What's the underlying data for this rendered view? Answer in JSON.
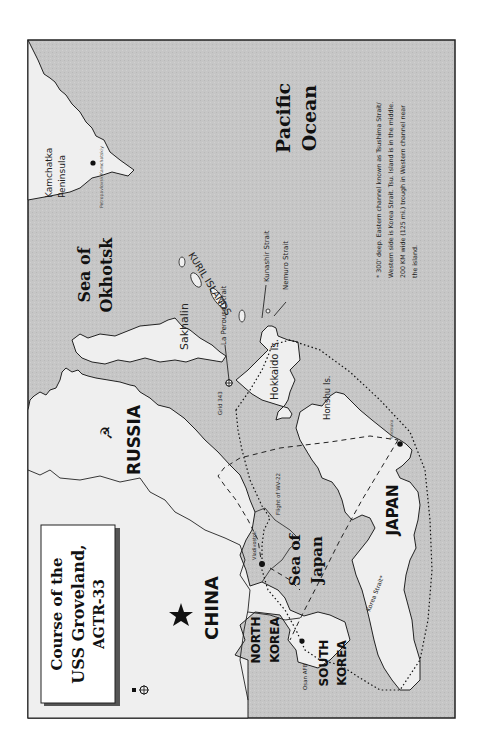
{
  "title": {
    "line1": "Course of the",
    "line2": "USS Groveland,",
    "line3": "AGTR-33"
  },
  "countries": {
    "russia": "RUSSIA",
    "china": "CHINA",
    "north_korea_1": "NORTH",
    "north_korea_2": "KOREA",
    "south_korea_1": "SOUTH",
    "south_korea_2": "KOREA",
    "japan": "JAPAN"
  },
  "seas": {
    "okhotsk_1": "Sea of",
    "okhotsk_2": "Okhotsk",
    "japan_1": "Sea of",
    "japan_2": "Japan",
    "pacific_1": "Pacific",
    "pacific_2": "Ocean"
  },
  "places": {
    "kamchatka_1": "Kamchatka",
    "kamchatka_2": "Peninsula",
    "petropavlovsk": "Petropavlovsk-Kamchatskiy",
    "kuril": "KURIL ISLANDS",
    "sakhalin": "Sakhalin",
    "la_perouse": "La Perouse Strait",
    "kunashir": "Kunashir Strait",
    "nemuro": "Nemuro Strait",
    "hokkaido": "Hokkaido Is.",
    "honshu": "Honshu Is.",
    "grid": "Grid 343",
    "vladivostok": "Vladivostok",
    "flight": "Flight of WV-22",
    "korea_strait": "Korea Strait*",
    "osan": "Osan AFB",
    "yokosuka": "Yokosuka"
  },
  "footnote": {
    "line1": "* 300' deep. Eastern channel known as Tsushima Strait/",
    "line2": "Western side is Korea Strait. Tsu. Island is in the middle.",
    "line3": "200 KM wide (125 mi.) trough in Western channel near",
    "line4": "the island."
  },
  "colors": {
    "sea": "#c4c4c4",
    "land": "#eeeeee",
    "border": "#222222"
  }
}
